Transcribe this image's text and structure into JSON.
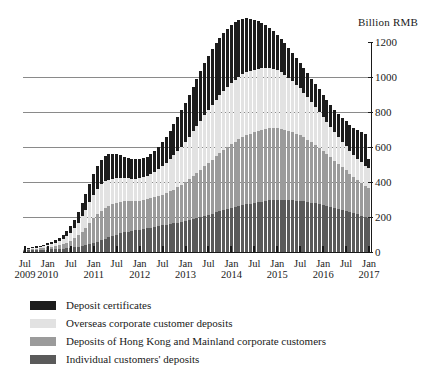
{
  "chart_data": {
    "type": "bar",
    "subtype": "stacked-bar",
    "title": "",
    "unit_label": "Billion RMB",
    "xlabel": "",
    "ylabel": "Billion RMB",
    "ylim": [
      0,
      1200
    ],
    "yticks": [
      0,
      200,
      400,
      600,
      800,
      1000,
      1200
    ],
    "gridlines": [
      200,
      400,
      600,
      800,
      1000
    ],
    "grid": true,
    "legend_position": "below",
    "x_tick_labels": [
      {
        "month": "Jul",
        "year": "2009"
      },
      {
        "month": "Jan",
        "year": "2010"
      },
      {
        "month": "Jul",
        "year": ""
      },
      {
        "month": "Jan",
        "year": "2011"
      },
      {
        "month": "Jul",
        "year": ""
      },
      {
        "month": "Jan",
        "year": "2012"
      },
      {
        "month": "Jul",
        "year": ""
      },
      {
        "month": "Jan",
        "year": "2013"
      },
      {
        "month": "Jul",
        "year": ""
      },
      {
        "month": "Jan",
        "year": "2014"
      },
      {
        "month": "Jul",
        "year": ""
      },
      {
        "month": "Jan",
        "year": "2015"
      },
      {
        "month": "Jul",
        "year": ""
      },
      {
        "month": "Jan",
        "year": "2016"
      },
      {
        "month": "Jul",
        "year": ""
      },
      {
        "month": "Jan",
        "year": "2017"
      }
    ],
    "x": [
      "2009-07",
      "2009-08",
      "2009-09",
      "2009-10",
      "2009-11",
      "2009-12",
      "2010-01",
      "2010-02",
      "2010-03",
      "2010-04",
      "2010-05",
      "2010-06",
      "2010-07",
      "2010-08",
      "2010-09",
      "2010-10",
      "2010-11",
      "2010-12",
      "2011-01",
      "2011-02",
      "2011-03",
      "2011-04",
      "2011-05",
      "2011-06",
      "2011-07",
      "2011-08",
      "2011-09",
      "2011-10",
      "2011-11",
      "2011-12",
      "2012-01",
      "2012-02",
      "2012-03",
      "2012-04",
      "2012-05",
      "2012-06",
      "2012-07",
      "2012-08",
      "2012-09",
      "2012-10",
      "2012-11",
      "2012-12",
      "2013-01",
      "2013-02",
      "2013-03",
      "2013-04",
      "2013-05",
      "2013-06",
      "2013-07",
      "2013-08",
      "2013-09",
      "2013-10",
      "2013-11",
      "2013-12",
      "2014-01",
      "2014-02",
      "2014-03",
      "2014-04",
      "2014-05",
      "2014-06",
      "2014-07",
      "2014-08",
      "2014-09",
      "2014-10",
      "2014-11",
      "2014-12",
      "2015-01",
      "2015-02",
      "2015-03",
      "2015-04",
      "2015-05",
      "2015-06",
      "2015-07",
      "2015-08",
      "2015-09",
      "2015-10",
      "2015-11",
      "2015-12",
      "2016-01",
      "2016-02",
      "2016-03",
      "2016-04",
      "2016-05",
      "2016-06",
      "2016-07",
      "2016-08",
      "2016-09",
      "2016-10",
      "2016-11",
      "2016-12",
      "2017-01"
    ],
    "series": [
      {
        "name": "Individual customers' deposits",
        "color": "#5a5a5a",
        "values": [
          8,
          9,
          10,
          11,
          12,
          13,
          14,
          15,
          17,
          18,
          20,
          22,
          24,
          27,
          30,
          34,
          38,
          44,
          52,
          60,
          68,
          76,
          84,
          92,
          100,
          106,
          112,
          116,
          120,
          124,
          128,
          132,
          136,
          140,
          144,
          148,
          152,
          156,
          160,
          164,
          168,
          172,
          178,
          184,
          190,
          196,
          202,
          208,
          214,
          220,
          226,
          232,
          238,
          244,
          250,
          256,
          262,
          268,
          272,
          276,
          280,
          284,
          288,
          292,
          295,
          298,
          300,
          300,
          299,
          298,
          296,
          294,
          292,
          289,
          286,
          282,
          278,
          274,
          270,
          265,
          260,
          254,
          248,
          242,
          236,
          229,
          222,
          215,
          208,
          201,
          195
        ]
      },
      {
        "name": "Deposits of Hong Kong and Mainland corporate customers",
        "color": "#9b9b9b",
        "values": [
          6,
          7,
          8,
          9,
          10,
          12,
          14,
          16,
          19,
          22,
          26,
          32,
          40,
          52,
          66,
          82,
          100,
          120,
          140,
          156,
          168,
          176,
          180,
          182,
          182,
          180,
          177,
          174,
          171,
          168,
          166,
          165,
          165,
          166,
          168,
          171,
          175,
          180,
          186,
          193,
          201,
          210,
          220,
          231,
          243,
          255,
          268,
          281,
          294,
          307,
          320,
          333,
          345,
          356,
          366,
          375,
          383,
          390,
          396,
          401,
          405,
          408,
          410,
          411,
          411,
          410,
          408,
          405,
          401,
          396,
          390,
          383,
          375,
          366,
          356,
          345,
          333,
          320,
          307,
          294,
          281,
          268,
          255,
          242,
          230,
          218,
          206,
          195,
          184,
          174,
          168
        ]
      },
      {
        "name": "Overseas corporate customer deposits",
        "color": "#e2e2e2",
        "values": [
          2,
          3,
          4,
          5,
          6,
          8,
          10,
          13,
          17,
          22,
          28,
          36,
          46,
          58,
          72,
          88,
          104,
          120,
          134,
          144,
          150,
          152,
          150,
          146,
          142,
          138,
          134,
          131,
          129,
          128,
          128,
          130,
          134,
          139,
          146,
          154,
          163,
          173,
          184,
          196,
          208,
          220,
          232,
          244,
          256,
          268,
          280,
          292,
          303,
          313,
          322,
          330,
          337,
          343,
          348,
          352,
          355,
          357,
          358,
          358,
          357,
          355,
          352,
          348,
          343,
          337,
          330,
          322,
          313,
          303,
          292,
          280,
          268,
          256,
          244,
          232,
          220,
          208,
          196,
          184,
          173,
          163,
          154,
          146,
          139,
          133,
          128,
          124,
          121,
          119,
          118
        ]
      },
      {
        "name": "Deposit certificates",
        "color": "#1c1c1c",
        "values": [
          4,
          5,
          6,
          7,
          8,
          10,
          12,
          14,
          17,
          20,
          24,
          30,
          38,
          48,
          60,
          74,
          90,
          106,
          120,
          132,
          140,
          144,
          144,
          140,
          134,
          128,
          122,
          117,
          113,
          110,
          108,
          108,
          110,
          114,
          120,
          128,
          138,
          150,
          163,
          177,
          192,
          208,
          224,
          240,
          256,
          271,
          285,
          298,
          309,
          318,
          325,
          330,
          333,
          334,
          333,
          330,
          325,
          318,
          309,
          298,
          286,
          273,
          259,
          245,
          231,
          217,
          204,
          192,
          181,
          171,
          162,
          154,
          147,
          141,
          136,
          132,
          129,
          127,
          126,
          126,
          127,
          129,
          132,
          136,
          141,
          147,
          154,
          162,
          171,
          181,
          49
        ]
      }
    ],
    "totals_note": "Stacked totals peak near 1160 in mid-2014 and fall to about 530 by Jan 2017"
  },
  "legend": {
    "items": [
      {
        "label": "Deposit certificates",
        "color": "#1c1c1c"
      },
      {
        "label": "Overseas corporate customer deposits",
        "color": "#e2e2e2"
      },
      {
        "label": "Deposits of Hong Kong and Mainland corporate customers",
        "color": "#9b9b9b"
      },
      {
        "label": "Individual customers' deposits",
        "color": "#5a5a5a"
      }
    ]
  }
}
